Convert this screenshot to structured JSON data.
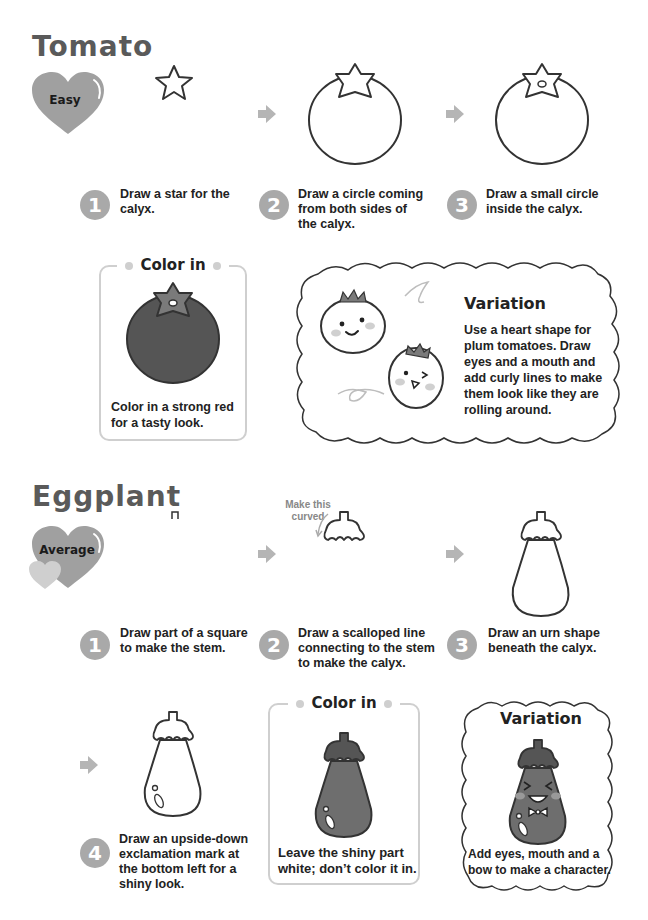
{
  "tomato": {
    "title": "Tomato",
    "difficulty": "Easy",
    "steps": [
      {
        "number": "1",
        "text": "Draw a star for the calyx."
      },
      {
        "number": "2",
        "text": "Draw a circle coming from both sides of the calyx."
      },
      {
        "number": "3",
        "text": "Draw a small circle inside the calyx."
      }
    ],
    "color_in": {
      "title": "Color in",
      "text": "Color in a strong red for a tasty look."
    },
    "variation": {
      "title": "Variation",
      "text": "Use a heart shape for plum tomatoes. Draw eyes and a mouth and add curly lines to make them look like they are rolling around."
    }
  },
  "eggplant": {
    "title": "Eggplant",
    "difficulty": "Average",
    "note": "Make this curved",
    "steps": [
      {
        "number": "1",
        "text": "Draw part of a square to make the stem."
      },
      {
        "number": "2",
        "text": "Draw a scalloped line connecting to the stem to make the calyx."
      },
      {
        "number": "3",
        "text": "Draw an urn shape beneath the calyx."
      },
      {
        "number": "4",
        "text": "Draw an upside-down exclamation mark at the bottom left for a shiny look."
      }
    ],
    "color_in": {
      "title": "Color in",
      "text": "Leave the shiny part white; don’t color it in."
    },
    "variation": {
      "title": "Variation",
      "text": "Add eyes, mouth and a bow to make a character."
    }
  },
  "colors": {
    "heading": "#5a5a5a",
    "heart": "#a0a0a0",
    "step_circle": "#a9a9a9",
    "arrow": "#b5b5b5",
    "box_border": "#cfcfcf",
    "tomato_fill": "#555555",
    "calyx_fill": "#7a7a7a",
    "eggplant_fill": "#6e6e6e"
  }
}
